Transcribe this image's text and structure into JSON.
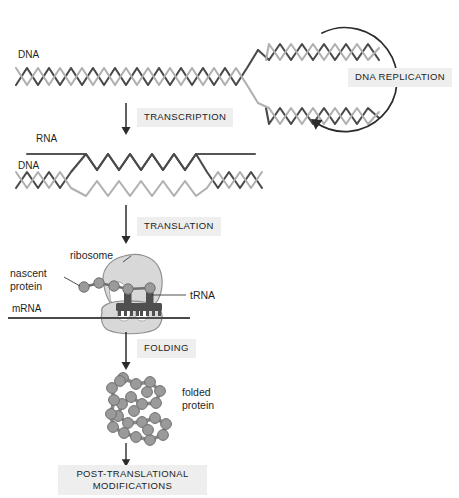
{
  "figure": {
    "background_color": "#ffffff"
  },
  "colors": {
    "strand_dark": "#4a4a4a",
    "strand_light": "#b0b0b0",
    "rna_line": "#555555",
    "ribosome_fill": "#d8d8d8",
    "ribosome_stroke": "#8f8f8f",
    "bead_fill": "#9a9a9a",
    "bead_stroke": "#6f6f6f",
    "trna_fill": "#4f4f4f",
    "arrow": "#2b2b2b",
    "label_plate": "#eeeeee",
    "text": "#1f1f1f",
    "leader_line": "#3a3a3a"
  },
  "molecule_labels": {
    "dna_top": "DNA",
    "rna": "RNA",
    "dna_transcription": "DNA",
    "mrna": "mRNA"
  },
  "process_labels": {
    "dna_replication": "DNA REPLICATION",
    "transcription": "TRANSCRIPTION",
    "translation": "TRANSLATION",
    "folding": "FOLDING",
    "post_translational": "POST-TRANSLATIONAL\nMODIFICATIONS"
  },
  "annotations": {
    "ribosome": "ribosome",
    "nascent_protein": "nascent\nprotein",
    "trna": "tRNA",
    "folded_protein": "folded\nprotein"
  },
  "steps": [
    {
      "id": "replication",
      "label": "DNA REPLICATION",
      "kind": "cycle-arrow"
    },
    {
      "id": "transcription",
      "label": "TRANSCRIPTION",
      "kind": "down-arrow"
    },
    {
      "id": "translation",
      "label": "TRANSLATION",
      "kind": "down-arrow"
    },
    {
      "id": "folding",
      "label": "FOLDING",
      "kind": "down-arrow"
    },
    {
      "id": "post-translational",
      "label": "POST-TRANSLATIONAL MODIFICATIONS",
      "kind": "terminal"
    }
  ]
}
